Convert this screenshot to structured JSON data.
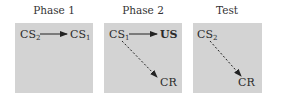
{
  "panels": [
    {
      "title": "Phase 1",
      "nodes": [
        {
          "id": "cs2",
          "base": "CS",
          "sub": "2"
        },
        {
          "id": "cs1",
          "base": "CS",
          "sub": "1"
        }
      ],
      "arrows": [
        {
          "from": "CS2",
          "to": "CS1",
          "style": "solid"
        }
      ]
    },
    {
      "title": "Phase 2",
      "nodes": [
        {
          "id": "cs1",
          "base": "CS",
          "sub": "1"
        },
        {
          "id": "us",
          "base": "US",
          "sub": ""
        },
        {
          "id": "cr",
          "base": "CR",
          "sub": ""
        }
      ],
      "arrows": [
        {
          "from": "CS1",
          "to": "US",
          "style": "solid"
        },
        {
          "from": "CS1",
          "to": "CR",
          "style": "dashed"
        }
      ]
    },
    {
      "title": "Test",
      "nodes": [
        {
          "id": "cs2",
          "base": "CS",
          "sub": "2"
        },
        {
          "id": "cr",
          "base": "CR",
          "sub": ""
        }
      ],
      "arrows": [
        {
          "from": "CS2",
          "to": "CR",
          "style": "dashed"
        }
      ]
    }
  ],
  "colors": {
    "panel_bg": "#d3d3d3",
    "arrow": "#222222"
  }
}
